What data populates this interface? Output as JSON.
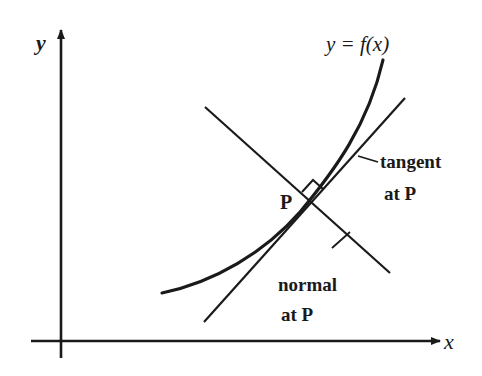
{
  "diagram": {
    "axes": {
      "x_label": "x",
      "y_label": "y"
    },
    "curve": {
      "label": "y = f(x)"
    },
    "point": {
      "label": "P"
    },
    "tangent": {
      "label_line1": "tangent",
      "label_line2": "at P"
    },
    "normal": {
      "label_line1": "normal",
      "label_line2": "at P"
    },
    "colors": {
      "ink": "#1a1a1a",
      "background": "#ffffff"
    }
  }
}
